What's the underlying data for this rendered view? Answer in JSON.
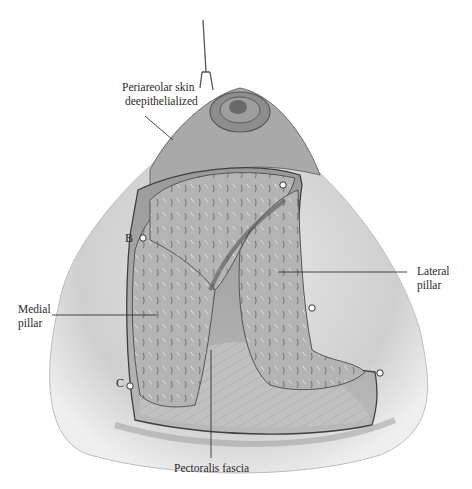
{
  "figure": {
    "type": "anatomical-illustration",
    "palette": {
      "skin_light": "#e6e6e6",
      "skin_mid": "#bdbdbd",
      "tissue": "#a8a8a8",
      "tissue_dark": "#6e6e6e",
      "outline": "#4a4a4a",
      "label_line": "#333333"
    },
    "labels": {
      "periareolar_line1": "Periareolar skin",
      "periareolar_line2": "deepithelialized",
      "medial_line1": "Medial",
      "medial_line2": "pillar",
      "lateral_line1": "Lateral",
      "lateral_line2": "pillar",
      "pectoralis": "Pectoralis fascia"
    },
    "points": {
      "b": "B",
      "c": "C"
    }
  }
}
